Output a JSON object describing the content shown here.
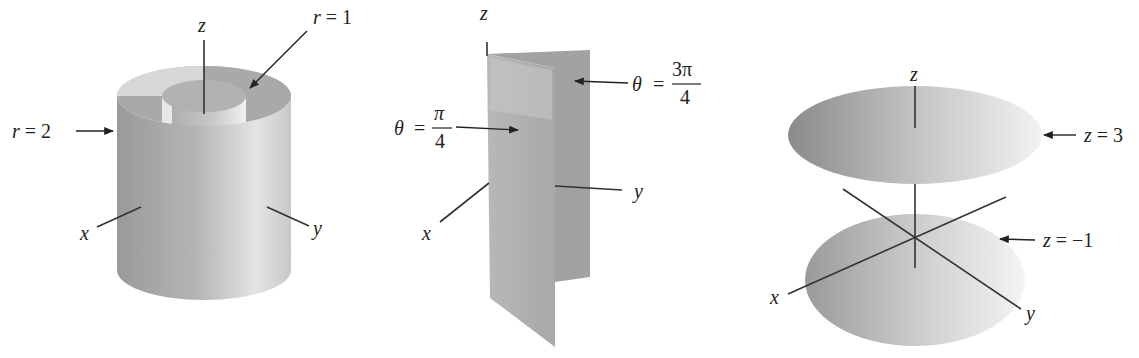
{
  "figures": [
    {
      "id": "cylinders",
      "description": "Two coaxial cylinders (constant r surfaces)",
      "axis_labels": {
        "x": "x",
        "y": "y",
        "z": "z"
      },
      "annotations": [
        {
          "var": "r",
          "eq": "=",
          "value": "1"
        },
        {
          "var": "r",
          "eq": "=",
          "value": "2"
        }
      ]
    },
    {
      "id": "half-planes",
      "description": "Two half-planes (constant theta surfaces)",
      "axis_labels": {
        "x": "x",
        "y": "y",
        "z": "z"
      },
      "annotations": [
        {
          "var": "θ",
          "eq": "=",
          "num": "π",
          "den": "4"
        },
        {
          "var": "θ",
          "eq": "=",
          "num": "3π",
          "den": "4"
        }
      ]
    },
    {
      "id": "horizontal-planes",
      "description": "Two horizontal discs (constant z surfaces)",
      "axis_labels": {
        "x": "x",
        "y": "y",
        "z": "z"
      },
      "annotations": [
        {
          "var": "z",
          "eq": "=",
          "value": "3"
        },
        {
          "var": "z",
          "eq": "=",
          "value": "−1"
        }
      ]
    }
  ],
  "colors": {
    "surface_dark": "#8e8e8e",
    "surface_mid": "#b5b5b5",
    "surface_light": "#ececec",
    "line": "#222222"
  }
}
